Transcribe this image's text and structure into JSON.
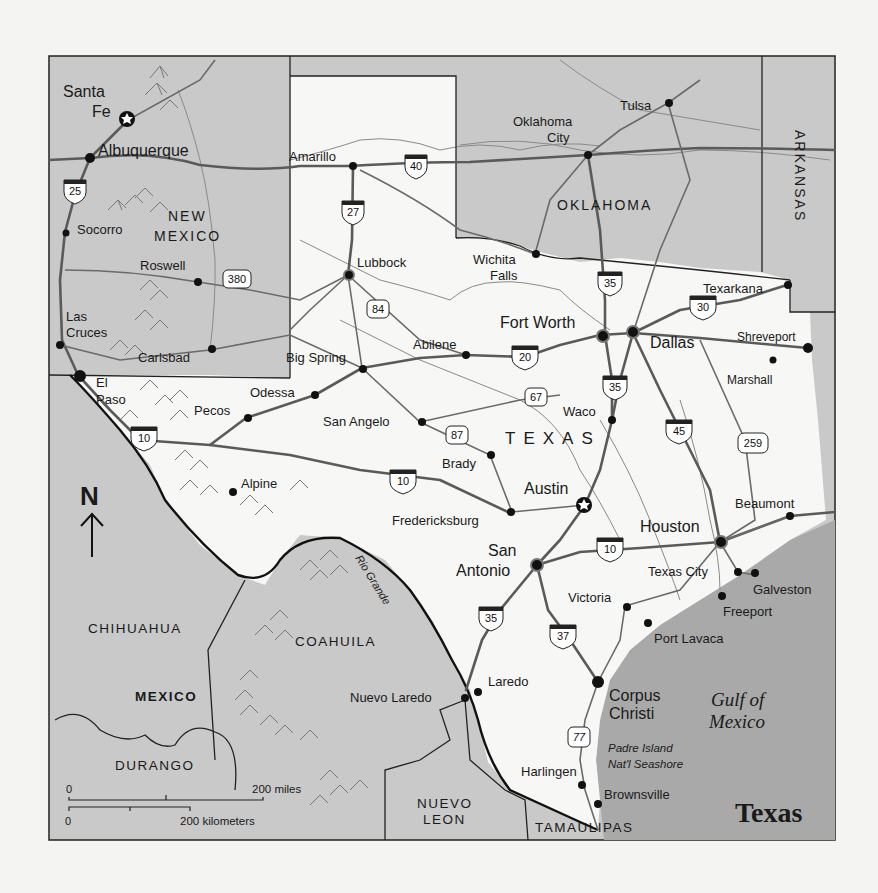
{
  "map": {
    "title": "Texas",
    "colors": {
      "page_background": "#f4f4f2",
      "texas_fill": "#f7f7f5",
      "neighbor_fill": "#c9c9c9",
      "gulf_fill": "#a9a9a9",
      "road": "#5a5a5a",
      "border": "#222222"
    },
    "compass": {
      "label": "N",
      "icon": "north-arrow-icon"
    },
    "scale_bar": {
      "miles_start": "0",
      "miles_end": "200 miles",
      "km_start": "0",
      "km_end": "200 kilometers"
    },
    "country_label": "TEXAS",
    "states": {
      "new_mexico_line1": "NEW",
      "new_mexico_line2": "MEXICO",
      "oklahoma": "OKLAHOMA",
      "arkansas": "ARKANSAS",
      "mexico": "MEXICO",
      "chihuahua": "CHIHUAHUA",
      "coahuila": "COAHUILA",
      "durango": "DURANGO",
      "nuevo_leon_line1": "NUEVO",
      "nuevo_leon_line2": "LEON",
      "tamaulipas": "TAMAULIPAS"
    },
    "water": {
      "gulf_line1": "Gulf of",
      "gulf_line2": "Mexico",
      "rio_grande": "Rio Grande",
      "padre_line1": "Padre Island",
      "padre_line2": "Nat'l Seashore"
    },
    "cities": {
      "santa_fe_1": "Santa",
      "santa_fe_2": "Fe",
      "albuquerque": "Albuquerque",
      "socorro": "Socorro",
      "roswell": "Roswell",
      "las_cruces_1": "Las",
      "las_cruces_2": "Cruces",
      "carlsbad": "Carlsbad",
      "el_paso_1": "El",
      "el_paso_2": "Paso",
      "pecos": "Pecos",
      "odessa": "Odessa",
      "big_spring": "Big Spring",
      "alpine": "Alpine",
      "amarillo": "Amarillo",
      "lubbock": "Lubbock",
      "abilene": "Abilene",
      "san_angelo": "San Angelo",
      "brady": "Brady",
      "fredericksburg": "Fredericksburg",
      "austin": "Austin",
      "san_antonio_1": "San",
      "san_antonio_2": "Antonio",
      "wichita_falls_1": "Wichita",
      "wichita_falls_2": "Falls",
      "fort_worth": "Fort Worth",
      "dallas": "Dallas",
      "waco": "Waco",
      "oklahoma_city_1": "Oklahoma",
      "oklahoma_city_2": "City",
      "tulsa": "Tulsa",
      "texarkana": "Texarkana",
      "shreveport": "Shreveport",
      "marshall": "Marshall",
      "beaumont": "Beaumont",
      "houston": "Houston",
      "texas_city": "Texas City",
      "galveston": "Galveston",
      "freeport": "Freeport",
      "victoria": "Victoria",
      "port_lavaca": "Port Lavaca",
      "corpus_christi_1": "Corpus",
      "corpus_christi_2": "Christi",
      "laredo": "Laredo",
      "nuevo_laredo": "Nuevo Laredo",
      "harlingen": "Harlingen",
      "brownsville": "Brownsville"
    },
    "highways": {
      "i25": "25",
      "i40": "40",
      "i27": "27",
      "us380": "380",
      "us84": "84",
      "i20": "20",
      "i35_north": "35",
      "i35_waco": "35",
      "i35_south": "35",
      "i30": "30",
      "i45": "45",
      "us259": "259",
      "us67": "67",
      "us87": "87",
      "i10_west": "10",
      "i10_central": "10",
      "i10_east": "10",
      "i37": "37",
      "us77": "77"
    }
  }
}
